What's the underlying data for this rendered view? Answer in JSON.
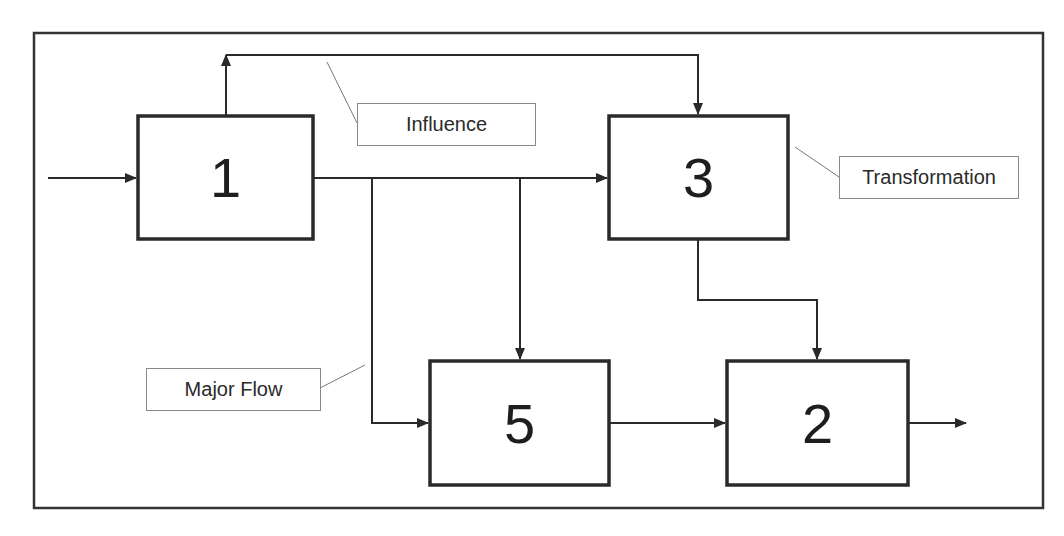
{
  "diagram": {
    "type": "block-flow-diagram",
    "blocks": [
      {
        "id": "1",
        "label": "1"
      },
      {
        "id": "3",
        "label": "3"
      },
      {
        "id": "5",
        "label": "5"
      },
      {
        "id": "2",
        "label": "2"
      }
    ],
    "annotations": {
      "influence": "Influence",
      "transformation": "Transformation",
      "major_flow": "Major Flow"
    },
    "edges": [
      {
        "from": "input",
        "to": "1",
        "kind": "major-flow"
      },
      {
        "from": "1",
        "to": "3",
        "kind": "major-flow"
      },
      {
        "from": "1",
        "to": "3",
        "kind": "influence",
        "route": "over-top"
      },
      {
        "from": "1",
        "to": "5",
        "kind": "major-flow",
        "route": "down-left-branch"
      },
      {
        "from": "1",
        "to": "5",
        "kind": "major-flow",
        "route": "down-middle-branch"
      },
      {
        "from": "3",
        "to": "2",
        "kind": "major-flow"
      },
      {
        "from": "5",
        "to": "2",
        "kind": "major-flow"
      },
      {
        "from": "2",
        "to": "output",
        "kind": "major-flow"
      }
    ],
    "colors": {
      "line": "#2a2a2a",
      "label_border": "#8a8a8a",
      "background": "#ffffff"
    }
  }
}
